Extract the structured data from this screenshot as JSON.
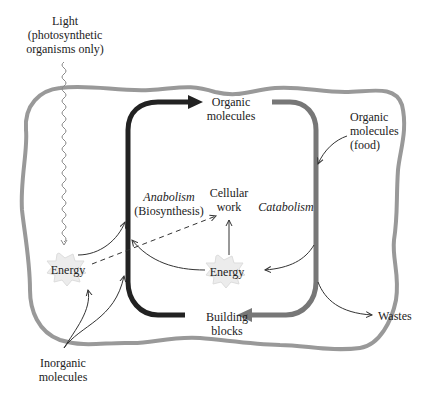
{
  "diagram": {
    "type": "metabolism-overview",
    "colors": {
      "cell_boundary": "#999999",
      "anabolism_arrow": "#222222",
      "catabolism_arrow": "#777777",
      "thin_arrow": "#333333",
      "energy_burst_fill": "#ececec",
      "text": "#222222"
    },
    "labels": {
      "light": "Light",
      "light_note_1": "(photosynthetic",
      "light_note_2": "organisms only)",
      "organic_molecules_1": "Organic",
      "organic_molecules_2": "molecules",
      "organic_food_1": "Organic",
      "organic_food_2": "molecules",
      "organic_food_3": "(food)",
      "anabolism": "Anabolism",
      "biosynthesis": "(Biosynthesis)",
      "cellular_work_1": "Cellular",
      "cellular_work_2": "work",
      "catabolism": "Catabolism",
      "energy_left": "Energy",
      "energy_center": "Energy",
      "building_blocks_1": "Building",
      "building_blocks_2": "blocks",
      "wastes": "Wastes",
      "inorganic_1": "Inorganic",
      "inorganic_2": "molecules"
    }
  }
}
